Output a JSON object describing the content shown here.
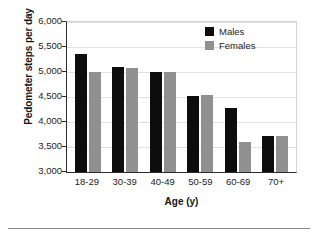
{
  "chart_data": {
    "type": "bar",
    "title": "",
    "categories": [
      "18-29",
      "30-39",
      "40-49",
      "50-59",
      "60-69",
      "70+"
    ],
    "series": [
      {
        "name": "Males",
        "color": "#0d0d0d",
        "values": [
          5360,
          5100,
          5000,
          4530,
          4280,
          3730
        ]
      },
      {
        "name": "Females",
        "color": "#909090",
        "values": [
          5010,
          5090,
          5010,
          4535,
          3600,
          3720
        ]
      }
    ],
    "xlabel": "Age (y)",
    "ylabel": "Pedometer steps per day",
    "ylim": [
      3000,
      6000
    ],
    "yticks": [
      "3,000",
      "3,500",
      "4,000",
      "4,500",
      "5,000",
      "5,500",
      "6,000"
    ],
    "ytick_values": [
      3000,
      3500,
      4000,
      4500,
      5000,
      5500,
      6000
    ],
    "grid": "horizontal",
    "legend_position": "top-right"
  }
}
